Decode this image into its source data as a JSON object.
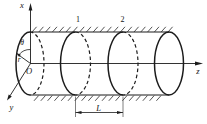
{
  "diagram": {
    "background_color": "#ffffff",
    "ink_color": "#1c1c1c",
    "labels": {
      "x_axis": "x",
      "y_axis": "y",
      "z_axis": "z",
      "origin": "O",
      "radius": "r",
      "angle_theta": "θ",
      "section_1": "1",
      "section_2": "2",
      "length_dimension": "L"
    }
  }
}
